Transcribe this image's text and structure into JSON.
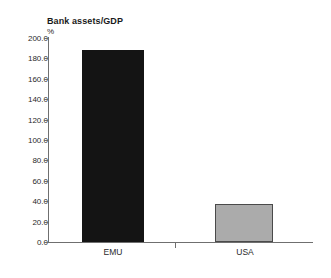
{
  "chart_data": {
    "type": "bar",
    "title": "Bank assets/GDP",
    "unit_label": "%",
    "xlabel": "",
    "ylabel": "%",
    "categories": [
      "EMU",
      "USA"
    ],
    "values": [
      188.0,
      37.0
    ],
    "series": [
      {
        "name": "Bank assets/GDP",
        "values": [
          188.0,
          37.0
        ]
      }
    ],
    "ylim": [
      0.0,
      200.0
    ],
    "ytick_step": 20.0,
    "ytick_labels": [
      "200.0",
      "180.0",
      "160.0",
      "140.0",
      "120.0",
      "100.0",
      "80.0",
      "60.0",
      "40.0",
      "20.0",
      "0.0"
    ],
    "ytick_values": [
      200.0,
      180.0,
      160.0,
      140.0,
      120.0,
      100.0,
      80.0,
      60.0,
      40.0,
      20.0,
      0.0
    ],
    "grid": false,
    "legend": false,
    "legend_position": "none",
    "bar_colors": [
      "#141414",
      "#ababab"
    ],
    "bar_border_colors": [
      "#141414",
      "#4a4a4a"
    ],
    "axis_color": "#6f6f6f",
    "background": "#ffffff"
  }
}
